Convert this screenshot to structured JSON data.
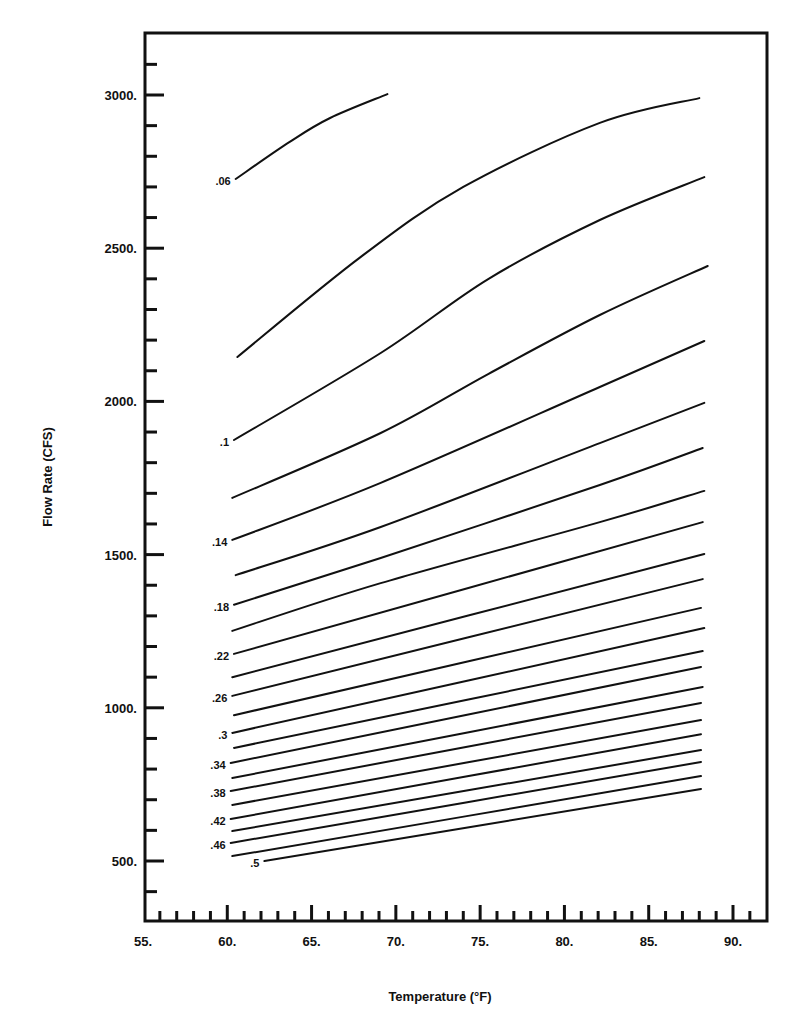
{
  "chart_data": {
    "type": "line",
    "title": "",
    "xlabel": "Temperature (°F)",
    "ylabel": "Flow Rate (CFS)",
    "xlim": [
      55,
      92
    ],
    "ylim": [
      300,
      3220
    ],
    "grid": false,
    "legend": "none (curves labeled inline at left ends)",
    "x_major_ticks": [
      55,
      60,
      65,
      70,
      75,
      80,
      85,
      90
    ],
    "x_tick_labels": [
      "55.",
      "60.",
      "65.",
      "70.",
      "75.",
      "80.",
      "85.",
      "90."
    ],
    "x_minor_tick_step": 1,
    "y_major_ticks": [
      500,
      1000,
      1500,
      2000,
      2500,
      3000
    ],
    "y_tick_labels": [
      "500.",
      "1000.",
      "1500.",
      "2000.",
      "2500.",
      "3000."
    ],
    "y_minor_tick_step": 100,
    "series": [
      {
        "name": ".06",
        "label": ".06",
        "points": [
          [
            60.5,
            2726
          ],
          [
            63.7,
            2847
          ],
          [
            66.1,
            2925
          ],
          [
            69.5,
            3003
          ]
        ]
      },
      {
        "name": ".08",
        "label": "",
        "points": [
          [
            60.6,
            2145
          ],
          [
            67.9,
            2471
          ],
          [
            74.0,
            2700
          ],
          [
            82.1,
            2909
          ],
          [
            88.0,
            2990
          ]
        ]
      },
      {
        "name": ".1",
        "label": ".1",
        "points": [
          [
            60.4,
            1874
          ],
          [
            69.1,
            2158
          ],
          [
            75.5,
            2400
          ],
          [
            82.1,
            2592
          ],
          [
            88.3,
            2732
          ]
        ]
      },
      {
        "name": ".12",
        "label": "",
        "points": [
          [
            60.3,
            1685
          ],
          [
            69.1,
            1897
          ],
          [
            75.5,
            2090
          ],
          [
            82.1,
            2282
          ],
          [
            88.5,
            2442
          ]
        ]
      },
      {
        "name": ".14",
        "label": ".14",
        "points": [
          [
            60.3,
            1548
          ],
          [
            69.1,
            1734
          ],
          [
            82.1,
            2047
          ],
          [
            88.3,
            2197
          ]
        ]
      },
      {
        "name": ".16",
        "label": "",
        "points": [
          [
            60.5,
            1433
          ],
          [
            69.1,
            1590
          ],
          [
            82.1,
            1864
          ],
          [
            88.3,
            1995
          ]
        ]
      },
      {
        "name": ".18",
        "label": ".18",
        "points": [
          [
            60.4,
            1336
          ],
          [
            69.1,
            1489
          ],
          [
            82.1,
            1727
          ],
          [
            88.2,
            1848
          ]
        ]
      },
      {
        "name": ".2",
        "label": "",
        "points": [
          [
            60.3,
            1251
          ],
          [
            69.1,
            1407
          ],
          [
            82.1,
            1606
          ],
          [
            88.3,
            1708
          ]
        ]
      },
      {
        "name": ".22",
        "label": ".22",
        "points": [
          [
            60.4,
            1176
          ],
          [
            88.2,
            1606
          ]
        ]
      },
      {
        "name": ".24",
        "label": "",
        "points": [
          [
            60.3,
            1100
          ],
          [
            88.3,
            1502
          ]
        ]
      },
      {
        "name": ".26",
        "label": ".26",
        "points": [
          [
            60.3,
            1039
          ],
          [
            88.2,
            1420
          ]
        ]
      },
      {
        "name": ".28",
        "label": "",
        "points": [
          [
            60.4,
            976
          ],
          [
            88.1,
            1326
          ]
        ]
      },
      {
        "name": ".3",
        "label": ".3",
        "points": [
          [
            60.3,
            918
          ],
          [
            88.3,
            1260
          ]
        ]
      },
      {
        "name": ".32",
        "label": "",
        "points": [
          [
            60.4,
            869
          ],
          [
            88.2,
            1185
          ]
        ]
      },
      {
        "name": ".34",
        "label": ".34",
        "points": [
          [
            60.2,
            820
          ],
          [
            88.1,
            1133
          ]
        ]
      },
      {
        "name": ".36",
        "label": "",
        "points": [
          [
            60.3,
            771
          ],
          [
            88.2,
            1068
          ]
        ]
      },
      {
        "name": ".38",
        "label": ".38",
        "points": [
          [
            60.2,
            728
          ],
          [
            88.1,
            1016
          ]
        ]
      },
      {
        "name": ".4",
        "label": "",
        "points": [
          [
            60.3,
            683
          ],
          [
            88.1,
            960
          ]
        ]
      },
      {
        "name": ".42",
        "label": ".42",
        "points": [
          [
            60.2,
            637
          ],
          [
            88.1,
            914
          ]
        ]
      },
      {
        "name": ".44",
        "label": "",
        "points": [
          [
            60.3,
            598
          ],
          [
            88.1,
            862
          ]
        ]
      },
      {
        "name": ".46",
        "label": ".46",
        "points": [
          [
            60.2,
            559
          ],
          [
            88.1,
            823
          ]
        ]
      },
      {
        "name": ".48",
        "label": "",
        "points": [
          [
            60.3,
            516
          ],
          [
            88.1,
            777
          ]
        ]
      },
      {
        "name": ".5",
        "label": ".5",
        "points": [
          [
            62.2,
            500
          ],
          [
            88.1,
            735
          ]
        ]
      }
    ]
  }
}
